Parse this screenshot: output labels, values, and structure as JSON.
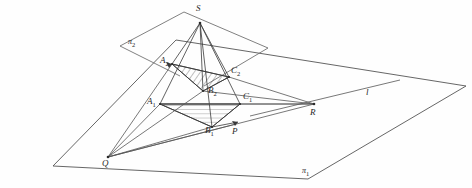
{
  "figure": {
    "background_color": "#fefefe",
    "stroke_color": "#3a3a3a",
    "hatch_color": "#4a4a4a",
    "label_color": "#262626"
  },
  "labels": {
    "apex": {
      "text": "S",
      "sub": "",
      "x": 196,
      "y": 4
    },
    "a2": {
      "text": "A",
      "sub": "2",
      "x": 160,
      "y": 56
    },
    "c2": {
      "text": "C",
      "sub": "2",
      "x": 231,
      "y": 66
    },
    "b2": {
      "text": "B",
      "sub": "2",
      "x": 208,
      "y": 89
    },
    "a1": {
      "text": "A",
      "sub": "1",
      "x": 148,
      "y": 98
    },
    "c1": {
      "text": "C",
      "sub": "1",
      "x": 243,
      "y": 93
    },
    "b1": {
      "text": "B",
      "sub": "1",
      "x": 205,
      "y": 123
    },
    "p": {
      "text": "P",
      "sub": "",
      "x": 232,
      "y": 128
    },
    "q": {
      "text": "Q",
      "sub": "",
      "x": 102,
      "y": 160
    },
    "r": {
      "text": "R",
      "sub": "",
      "x": 310,
      "y": 110
    },
    "line_l": {
      "text": "l",
      "sub": "",
      "x": 366,
      "y": 90
    },
    "plane1": {
      "text": "π",
      "sub": "1",
      "x": 302,
      "y": 169
    },
    "plane2": {
      "text": "π",
      "sub": "2",
      "x": 128,
      "y": 40
    }
  },
  "points": {
    "S": {
      "x": 200,
      "y": 23
    },
    "A2": {
      "x": 172,
      "y": 64
    },
    "C2": {
      "x": 229,
      "y": 77
    },
    "B2": {
      "x": 203,
      "y": 91
    },
    "A1": {
      "x": 160,
      "y": 104
    },
    "C1": {
      "x": 240,
      "y": 104
    },
    "B1": {
      "x": 212,
      "y": 127
    },
    "P": {
      "x": 236,
      "y": 124
    },
    "Q": {
      "x": 108,
      "y": 157
    },
    "R": {
      "x": 314,
      "y": 104
    }
  },
  "plane1_outline": [
    {
      "x": 53,
      "y": 166
    },
    {
      "x": 176,
      "y": 40
    },
    {
      "x": 466,
      "y": 86
    },
    {
      "x": 308,
      "y": 179
    }
  ],
  "plane2_outline": [
    {
      "x": 120,
      "y": 46
    },
    {
      "x": 184,
      "y": 12
    },
    {
      "x": 268,
      "y": 48
    },
    {
      "x": 204,
      "y": 86
    }
  ],
  "line_l_segment": {
    "x1": 250,
    "y1": 116,
    "x2": 400,
    "y2": 80
  },
  "shaded_faces": [
    {
      "name": "upper-triangle-A2-C2-B2",
      "vertices": [
        "A2",
        "C2",
        "B2"
      ]
    },
    {
      "name": "lower-triangle-A1-C1-B1",
      "vertices": [
        "A1",
        "C1",
        "B1"
      ]
    }
  ],
  "edges": [
    {
      "name": "S-A2",
      "from": "S",
      "to": "A2"
    },
    {
      "name": "S-B2",
      "from": "S",
      "to": "B2"
    },
    {
      "name": "S-C2",
      "from": "S",
      "to": "C2"
    },
    {
      "name": "S-A1",
      "from": "S",
      "to": "A1"
    },
    {
      "name": "S-B1",
      "from": "S",
      "to": "B1"
    },
    {
      "name": "S-C1",
      "from": "S",
      "to": "C1"
    },
    {
      "name": "A2-C2",
      "from": "A2",
      "to": "C2"
    },
    {
      "name": "A2-B2",
      "from": "A2",
      "to": "B2"
    },
    {
      "name": "B2-C2",
      "from": "B2",
      "to": "C2"
    },
    {
      "name": "A1-C1",
      "from": "A1",
      "to": "C1"
    },
    {
      "name": "A1-B1",
      "from": "A1",
      "to": "B1"
    },
    {
      "name": "B1-C1",
      "from": "B1",
      "to": "C1"
    },
    {
      "name": "Q-A1",
      "from": "Q",
      "to": "A1"
    },
    {
      "name": "Q-B1",
      "from": "Q",
      "to": "B1"
    },
    {
      "name": "Q-P",
      "from": "Q",
      "to": "P"
    },
    {
      "name": "Q-R",
      "from": "Q",
      "to": "R"
    },
    {
      "name": "A1-R",
      "from": "A1",
      "to": "R"
    },
    {
      "name": "B2-R",
      "from": "B2",
      "to": "R"
    },
    {
      "name": "C1-R",
      "from": "C1",
      "to": "R"
    },
    {
      "name": "B1-P",
      "from": "B1",
      "to": "P"
    }
  ]
}
